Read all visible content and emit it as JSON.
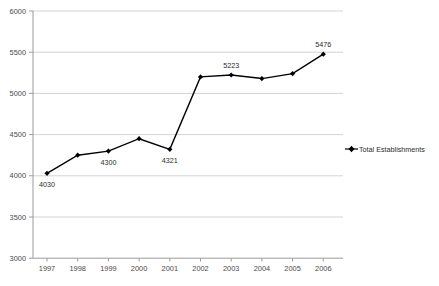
{
  "chart_data": {
    "type": "line",
    "title": "",
    "subtitle": "",
    "xlabel": "",
    "ylabel": "",
    "categories": [
      "1997",
      "1998",
      "1999",
      "2000",
      "2001",
      "2002",
      "2003",
      "2004",
      "2005",
      "2006"
    ],
    "series": [
      {
        "name": "Total Establishments",
        "values": [
          4030,
          4250,
          4300,
          4450,
          4321,
          5200,
          5223,
          5180,
          5240,
          5476
        ],
        "color": "#000000",
        "marker": "diamond"
      }
    ],
    "point_labels": [
      {
        "category": "1997",
        "value": 4030,
        "text": "4030"
      },
      {
        "category": "1999",
        "value": 4300,
        "text": "4300"
      },
      {
        "category": "2001",
        "value": 4321,
        "text": "4321"
      },
      {
        "category": "2003",
        "value": 5223,
        "text": "5223"
      },
      {
        "category": "2006",
        "value": 5476,
        "text": "5476"
      }
    ],
    "ylim": [
      3000,
      6000
    ],
    "ytick_step": 500,
    "ytick_labels": [
      "6000",
      "5500",
      "5000",
      "4500",
      "4000",
      "3500",
      "3000"
    ],
    "xtick_labels": [
      "1997",
      "1998",
      "1999",
      "2000",
      "2001",
      "2002",
      "2003",
      "2004",
      "2005",
      "2006"
    ],
    "grid": true,
    "grid_axis": "y",
    "grid_color": "#c8c8c8",
    "axis_color": "#9a9a9a",
    "legend": {
      "position": "right",
      "entries": [
        {
          "label": "Total Establishments",
          "color": "#000000",
          "marker": "diamond"
        }
      ]
    }
  }
}
